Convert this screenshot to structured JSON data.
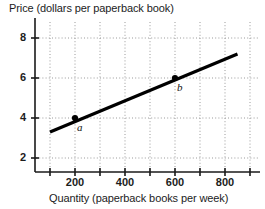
{
  "chart_data": {
    "type": "line",
    "title": "",
    "ylabel": "Price (dollars per paperback book)",
    "xlabel": "Quantity (paperback books per week)",
    "xlim": [
      0,
      1000
    ],
    "ylim": [
      0,
      9
    ],
    "grid": true,
    "legend": "none",
    "xticks": [
      200,
      400,
      600,
      800
    ],
    "xtick_labels": [
      "200",
      "400",
      "600",
      "800"
    ],
    "yticks": [
      2,
      4,
      6,
      8
    ],
    "ytick_labels": [
      "2",
      "4",
      "6",
      "8"
    ],
    "gridlines_x": [
      100,
      200,
      300,
      400,
      500,
      600,
      700,
      800,
      900
    ],
    "gridlines_y": [
      2,
      4,
      6,
      8
    ],
    "series": [
      {
        "name": "demand-line",
        "x": [
          100,
          850
        ],
        "y": [
          3.3,
          7.2
        ],
        "color": "#000000"
      }
    ],
    "points": [
      {
        "label": "a",
        "x": 200,
        "y": 4
      },
      {
        "label": "b",
        "x": 600,
        "y": 6
      }
    ]
  },
  "axes": {
    "color": "#1a1a1a",
    "grid_color": "#9a9a9a"
  }
}
